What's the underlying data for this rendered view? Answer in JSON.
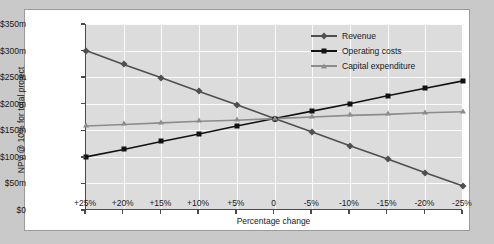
{
  "chart_data": {
    "type": "line",
    "title": "",
    "xlabel": "Percentage change",
    "ylabel": "NPV @ 10% for total project",
    "categories": [
      "+25%",
      "+20%",
      "+15%",
      "+10%",
      "+5%",
      "0",
      "-5%",
      "-10%",
      "-15%",
      "-20%",
      "-25%"
    ],
    "x": [
      25,
      20,
      15,
      10,
      5,
      0,
      -5,
      -10,
      -15,
      -20,
      -25
    ],
    "xlim": [
      25,
      -25
    ],
    "ylim": [
      0,
      350
    ],
    "yticks": [
      0,
      50,
      100,
      150,
      200,
      250,
      300,
      350
    ],
    "ytick_labels": [
      "$0",
      "$50m",
      "$100m",
      "$150m",
      "$200m",
      "$250m",
      "$300m",
      "$350m"
    ],
    "grid": true,
    "legend_position": "top-right",
    "series": [
      {
        "name": "Revenue",
        "marker": "diamond",
        "color": "#4f4f4f",
        "values": [
          300,
          274,
          249,
          223,
          198,
          172,
          147,
          121,
          96,
          70,
          45
        ]
      },
      {
        "name": "Operating costs",
        "marker": "square",
        "color": "#121212",
        "values": [
          100,
          114,
          129,
          143,
          158,
          172,
          186,
          200,
          215,
          229,
          243
        ]
      },
      {
        "name": "Capital expenditure",
        "marker": "triangle",
        "color": "#8c8c8c",
        "values": [
          158,
          161,
          164,
          167,
          169,
          172,
          175,
          178,
          180,
          183,
          185
        ]
      }
    ]
  }
}
